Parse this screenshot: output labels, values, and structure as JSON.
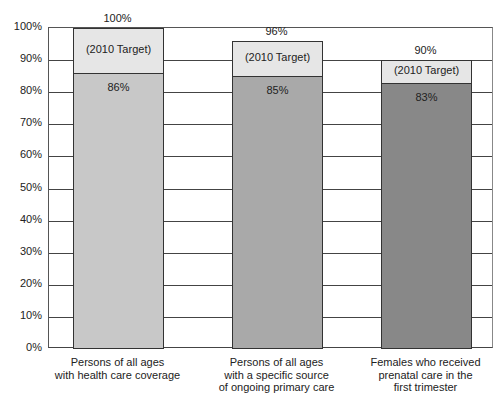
{
  "chart_data": {
    "type": "bar",
    "stacked": true,
    "title": "",
    "xlabel": "",
    "ylabel": "",
    "ylim": [
      0,
      100
    ],
    "yticks": [
      "0%",
      "10%",
      "20%",
      "30%",
      "40%",
      "50%",
      "60%",
      "70%",
      "80%",
      "90%",
      "100%"
    ],
    "grid": true,
    "categories": [
      "Persons of all ages\nwith health care coverage",
      "Persons of all ages\nwith a specific source\nof ongoing primary care",
      "Females who received\nprenatal care in the\nfirst trimester"
    ],
    "series": [
      {
        "name": "Actual",
        "values": [
          86,
          85,
          83
        ],
        "labels": [
          "86%",
          "85%",
          "83%"
        ],
        "colors": [
          "#c8c8c8",
          "#a9a9a9",
          "#888888"
        ]
      },
      {
        "name": "2010 Target",
        "values": [
          100,
          96,
          90
        ],
        "labels": [
          "100%",
          "96%",
          "90%"
        ],
        "segment_label": "(2010 Target)",
        "color": "#e6e6e6"
      }
    ]
  }
}
